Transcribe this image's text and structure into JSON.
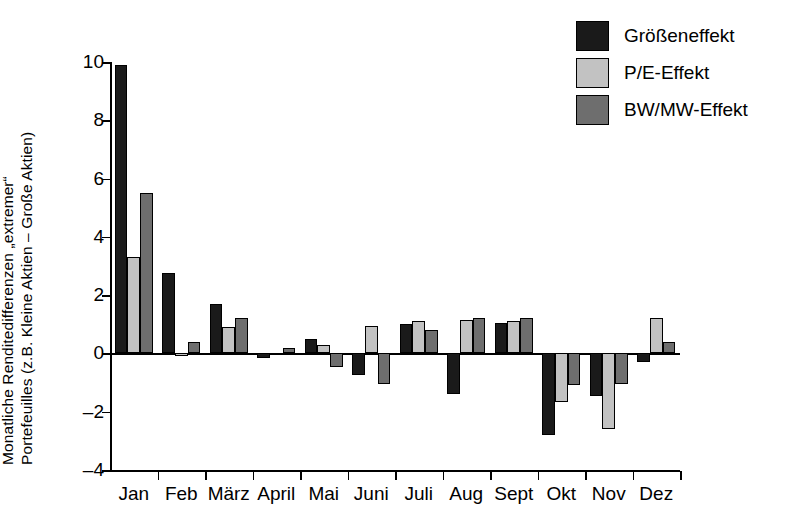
{
  "chart_data": {
    "type": "bar",
    "title": "",
    "subtitle": "",
    "xlabel": "",
    "ylabel_line1": "Monatliche Renditedifferenzen „extremer“",
    "ylabel_line2": "Portefeuilles (z.B. Kleine Aktien – Große Aktien)",
    "categories": [
      "Jan",
      "Feb",
      "März",
      "April",
      "Mai",
      "Juni",
      "Juli",
      "Aug",
      "Sept",
      "Okt",
      "Nov",
      "Dez"
    ],
    "series": [
      {
        "name": "Größeneffekt",
        "color": "#1a1a1a",
        "values": [
          9.9,
          2.75,
          1.7,
          -0.15,
          0.5,
          -0.75,
          1.0,
          -1.4,
          1.05,
          -2.8,
          -1.45,
          -0.3
        ]
      },
      {
        "name": "P/E-Effekt",
        "color": "#c2c2c2",
        "values": [
          3.3,
          -0.1,
          0.9,
          0.0,
          0.3,
          0.95,
          1.1,
          1.15,
          1.1,
          -1.65,
          -2.6,
          1.2
        ]
      },
      {
        "name": "BW/MW-Effekt",
        "color": "#6e6e6e",
        "values": [
          5.5,
          0.4,
          1.2,
          0.2,
          -0.45,
          -1.05,
          0.8,
          1.2,
          1.2,
          -1.1,
          -1.05,
          0.4
        ]
      }
    ],
    "ylim": [
      -4,
      10
    ],
    "yticks": [
      10,
      8,
      6,
      4,
      2,
      0,
      -2,
      -4
    ],
    "ytick_labels": [
      "10",
      "8",
      "6",
      "4",
      "2",
      "0",
      "–2",
      "–4"
    ],
    "grid": false,
    "legend_position": "top-right",
    "legend_entries": [
      "Größeneffekt",
      "P/E-Effekt",
      "BW/MW-Effekt"
    ]
  }
}
